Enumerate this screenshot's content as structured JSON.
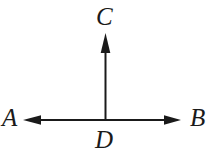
{
  "figure": {
    "background_color": "#ffffff",
    "stroke_color": "#1a1a1a",
    "width": 219,
    "height": 157,
    "labels": {
      "A": "A",
      "B": "B",
      "C": "C",
      "D": "D"
    },
    "points": {
      "A": {
        "name": "A",
        "x": 23,
        "y": 120
      },
      "B": {
        "name": "B",
        "x": 181,
        "y": 120
      },
      "C": {
        "name": "C",
        "x": 105,
        "y": 33
      },
      "D": {
        "name": "D",
        "x": 105,
        "y": 120
      }
    },
    "rays": [
      {
        "name": "ray-DA",
        "from": "D",
        "to": "A",
        "direction": "left",
        "arrowhead": true
      },
      {
        "name": "ray-DB",
        "from": "D",
        "to": "B",
        "direction": "right",
        "arrowhead": true
      },
      {
        "name": "ray-DC",
        "from": "D",
        "to": "C",
        "direction": "up",
        "arrowhead": true
      }
    ],
    "geometry": {
      "horizontal_line_y": 120,
      "vertical_line_x": 105,
      "line_width": 2,
      "arrow_length": 17,
      "arrow_half_width": 5
    }
  }
}
